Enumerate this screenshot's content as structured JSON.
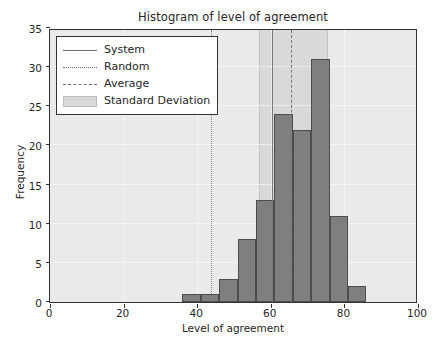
{
  "chart_data": {
    "type": "bar",
    "title": "Histogram of level of agreement",
    "xlabel": "Level of agreement",
    "ylabel": "Frequency",
    "xlim": [
      0,
      100
    ],
    "ylim": [
      0,
      35
    ],
    "xticks": [
      0,
      20,
      40,
      60,
      80,
      100
    ],
    "yticks": [
      0,
      5,
      10,
      15,
      20,
      25,
      30,
      35
    ],
    "grid": true,
    "legend_position": "upper left",
    "bin_width": 5,
    "bin_edges": [
      36,
      41,
      46,
      51,
      56,
      61,
      66,
      71,
      76,
      81,
      86,
      91
    ],
    "categories": [
      "36-41",
      "41-46",
      "46-51",
      "51-56",
      "56-61",
      "61-66",
      "66-71",
      "71-76",
      "76-81",
      "81-86",
      "86-91"
    ],
    "values": [
      1,
      1,
      3,
      8,
      13,
      24,
      22,
      31,
      11,
      2,
      0
    ],
    "series": [
      {
        "name": "Frequency",
        "values": [
          1,
          1,
          3,
          8,
          13,
          24,
          22,
          31,
          11,
          2,
          0
        ]
      }
    ],
    "annotations": [
      {
        "name": "System",
        "type": "vline",
        "style": "solid",
        "x": 60.2
      },
      {
        "name": "Random",
        "type": "vline",
        "style": "dotted",
        "x": 43.8
      },
      {
        "name": "Average",
        "type": "vline",
        "style": "dashed",
        "x": 65.5
      },
      {
        "name": "Standard Deviation",
        "type": "vspan",
        "style": "shaded",
        "x0": 56.8,
        "x1": 75.6
      }
    ],
    "colors": {
      "bar_face": "#7f7f7f",
      "bar_edge": "#4d4d4d",
      "std_band": "#d9d9d9",
      "axes_bg": "#eaeaea",
      "grid": "#ffffff",
      "text": "#262626"
    }
  },
  "legend": {
    "items": [
      {
        "label": "System",
        "key": "solid-line"
      },
      {
        "label": "Random",
        "key": "dotted-line"
      },
      {
        "label": "Average",
        "key": "dashed-line"
      },
      {
        "label": "Standard Deviation",
        "key": "shaded-patch"
      }
    ]
  }
}
